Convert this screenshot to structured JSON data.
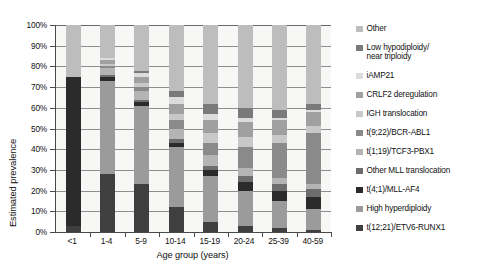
{
  "chart_data": {
    "type": "bar",
    "subtype": "stacked-bar-100-percent",
    "title": "",
    "xlabel": "Age group (years)",
    "ylabel": "Estimated prevalence",
    "ylim": [
      0,
      100
    ],
    "ytick_labels": [
      "100%",
      "90%",
      "80%",
      "70%",
      "60%",
      "50%",
      "40%",
      "30%",
      "20%",
      "10%",
      "0%"
    ],
    "ytick_values": [
      100,
      90,
      80,
      70,
      60,
      50,
      40,
      30,
      20,
      10,
      0
    ],
    "grid": true,
    "legend_position": "right",
    "categories": [
      "<1",
      "1-4",
      "5-9",
      "10-14",
      "15-19",
      "20-24",
      "25-39",
      "40-59"
    ],
    "series": [
      {
        "name": "t(12;21)/ETV6-RUNX1",
        "color": "#3f3f3f",
        "values": [
          3,
          28,
          23,
          12,
          5,
          3,
          2,
          1
        ]
      },
      {
        "name": "High hyperdiploidy",
        "color": "#9b9b9b",
        "values": [
          0,
          45,
          38,
          29,
          22,
          17,
          13,
          10
        ]
      },
      {
        "name": "t(4;1)/MLL-AF4",
        "color": "#2b2b2b",
        "values": [
          72,
          2,
          2,
          2,
          3,
          4,
          5,
          6
        ]
      },
      {
        "name": "Other MLL translocation",
        "color": "#6d6d6d",
        "values": [
          0,
          1,
          1,
          2,
          2,
          3,
          3,
          4
        ]
      },
      {
        "name": "t(1;19)/TCF3-PBX1",
        "color": "#b4b4b4",
        "values": [
          0,
          3,
          4,
          5,
          5,
          4,
          3,
          2
        ]
      },
      {
        "name": "t(9;22)/BCR-ABL1",
        "color": "#8a8a8a",
        "values": [
          0,
          1,
          2,
          4,
          6,
          10,
          17,
          25
        ]
      },
      {
        "name": "IGH translocation",
        "color": "#c8c8c8",
        "values": [
          0,
          1,
          2,
          3,
          5,
          5,
          4,
          3
        ]
      },
      {
        "name": "CRLF2 deregulation",
        "color": "#a0a0a0",
        "values": [
          0,
          2,
          3,
          5,
          6,
          7,
          7,
          7
        ]
      },
      {
        "name": "iAMP21",
        "color": "#dcdcdc",
        "values": [
          0,
          1,
          2,
          3,
          3,
          2,
          1,
          1
        ]
      },
      {
        "name": "Low hypodiploidy/\nnear triploidy",
        "color": "#7a7a7a",
        "values": [
          0,
          0,
          1,
          3,
          5,
          5,
          4,
          3
        ]
      },
      {
        "name": "Other",
        "color": "#bdbdbd",
        "values": [
          25,
          16,
          22,
          32,
          38,
          40,
          41,
          38
        ]
      }
    ],
    "legend_entries": [
      {
        "label": "Other",
        "color": "#bdbdbd"
      },
      {
        "label": "Low hypodiploidy/\nnear triploidy",
        "color": "#7a7a7a"
      },
      {
        "label": "iAMP21",
        "color": "#dcdcdc"
      },
      {
        "label": "CRLF2 deregulation",
        "color": "#a0a0a0"
      },
      {
        "label": "IGH translocation",
        "color": "#c8c8c8"
      },
      {
        "label": "t(9;22)/BCR-ABL1",
        "color": "#8a8a8a"
      },
      {
        "label": "t(1;19)/TCF3-PBX1",
        "color": "#b4b4b4"
      },
      {
        "label": "Other MLL translocation",
        "color": "#6d6d6d"
      },
      {
        "label": "t(4;1)/MLL-AF4",
        "color": "#2b2b2b"
      },
      {
        "label": "High hyperdiploidy",
        "color": "#9b9b9b"
      },
      {
        "label": "t(12;21)/ETV6-RUNX1",
        "color": "#3f3f3f"
      }
    ]
  },
  "colors": {
    "plot_background": "#f7f7f5",
    "axis": "#4a4a4a",
    "gridline": "#8d8d8d",
    "text": "#111111"
  }
}
